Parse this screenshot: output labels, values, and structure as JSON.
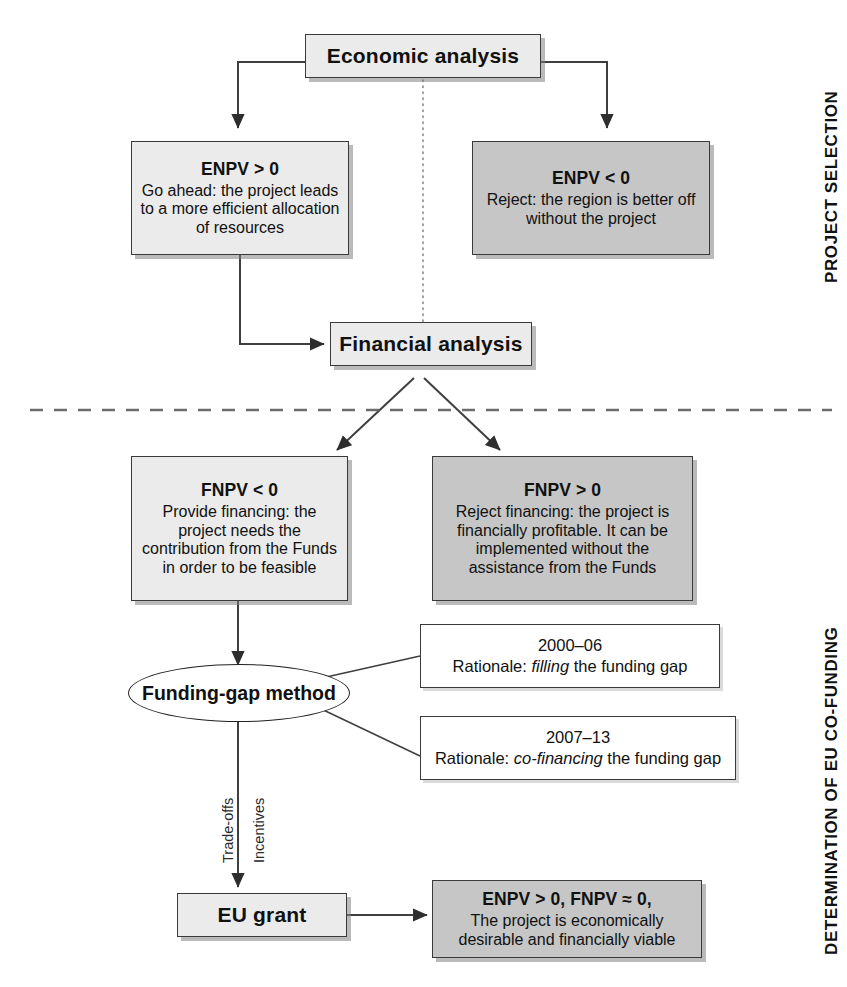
{
  "diagram": {
    "title_hidden": "",
    "side_labels": [
      {
        "text": "PROJECT SELECTION"
      },
      {
        "text": "DETERMINATION OF EU CO-FUNDING"
      }
    ],
    "nodes": {
      "economic_analysis": {
        "label": "Economic analysis"
      },
      "enpv_positive": {
        "header": "ENPV > 0",
        "body": "Go ahead: the project leads to a more efficient allocation of resources"
      },
      "enpv_negative": {
        "header": "ENPV < 0",
        "body": "Reject: the region is better off without the project"
      },
      "financial_analysis": {
        "label": "Financial analysis"
      },
      "fnpv_negative": {
        "header": "FNPV < 0",
        "body": "Provide financing: the project needs the contribution from the Funds in order to be feasible"
      },
      "fnpv_positive": {
        "header": "FNPV > 0",
        "body": "Reject financing: the project is financially profitable. It can be implemented without the assistance from the Funds"
      },
      "funding_gap_method": {
        "label": "Funding-gap method"
      },
      "rationale_2000_06": {
        "period": "2000–06",
        "line_prefix": "Rationale: ",
        "line_emphasis": "filling",
        "line_suffix": " the funding gap"
      },
      "rationale_2007_13": {
        "period": "2007–13",
        "line_prefix": "Rationale: ",
        "line_emphasis": "co-financing",
        "line_suffix": " the funding gap"
      },
      "eu_grant": {
        "label": "EU grant"
      },
      "outcome": {
        "header": "ENPV > 0, FNPV ≈ 0,",
        "body": "The project is economically desirable and financially viable"
      }
    },
    "edge_labels": [
      {
        "text": "Trade-offs"
      },
      {
        "text": "Incentives"
      }
    ],
    "colors": {
      "box_light_fill": "#ebebeb",
      "box_dark_fill": "#c6c6c6",
      "box_plain_fill": "#ffffff",
      "border": "#3a3a3a",
      "line": "#3f3f3f",
      "text": "#111111"
    }
  }
}
